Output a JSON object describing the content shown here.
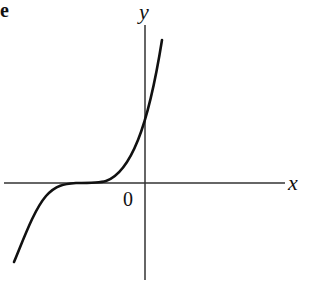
{
  "figure": {
    "corner_label": "e",
    "axes": {
      "x_label": "x",
      "y_label": "y",
      "origin_label": "0"
    },
    "curve": {
      "description": "cubic-shaped curve with horizontal inflection left of the origin, crossing the y-axis above the origin",
      "color": "#111111"
    },
    "colors": {
      "axis": "#333333",
      "curve": "#111111",
      "background": "#ffffff"
    }
  }
}
